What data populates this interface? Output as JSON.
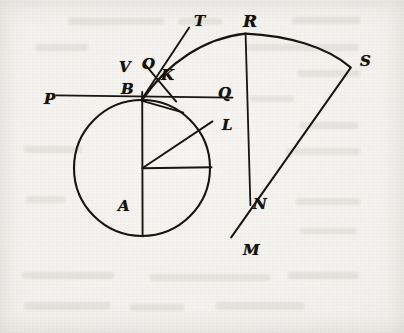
{
  "figure": {
    "kind": "geometric-construction-diagram",
    "medium": "scanned engraving on aged paper",
    "background_color": "#f2f0ec",
    "ink_color": "#151310",
    "width": 404,
    "height": 333
  },
  "labels": [
    {
      "id": "P",
      "text": "P",
      "x": 44,
      "y": 92,
      "size": "md",
      "role": "left end of horizontal line through B"
    },
    {
      "id": "V",
      "text": "V",
      "x": 119,
      "y": 60,
      "size": "md",
      "role": "upper-left point above B"
    },
    {
      "id": "O",
      "text": "O",
      "x": 142,
      "y": 57,
      "size": "md",
      "role": "point on vertical above B"
    },
    {
      "id": "B",
      "text": "B",
      "x": 121,
      "y": 82,
      "size": "md",
      "role": "top of circle, vertex of sector"
    },
    {
      "id": "K",
      "text": "K",
      "x": 161,
      "y": 68,
      "size": "md",
      "role": "intersection of the two oblique lines"
    },
    {
      "id": "T",
      "text": "T",
      "x": 194,
      "y": 14,
      "size": "md",
      "role": "upper end of oblique line from B"
    },
    {
      "id": "R",
      "text": "R",
      "x": 243,
      "y": 13,
      "size": "lg",
      "role": "start of outer circular arc"
    },
    {
      "id": "S",
      "text": "S",
      "x": 360,
      "y": 54,
      "size": "md",
      "role": "far end of outer circular arc"
    },
    {
      "id": "Q",
      "text": "Q",
      "x": 218,
      "y": 86,
      "size": "md",
      "role": "right end of horizontal line through B"
    },
    {
      "id": "L",
      "text": "L",
      "x": 222,
      "y": 118,
      "size": "md",
      "role": "point on circle along radius AL"
    },
    {
      "id": "A",
      "text": "A",
      "x": 118,
      "y": 199,
      "size": "md",
      "role": "centre of the circle"
    },
    {
      "id": "N",
      "text": "N",
      "x": 253,
      "y": 197,
      "size": "md",
      "role": "right of circle on horizontal radius"
    },
    {
      "id": "M",
      "text": "M",
      "x": 243,
      "y": 243,
      "size": "md",
      "role": "point on circle below N"
    }
  ],
  "geometry": {
    "circle": {
      "cx": 142,
      "cy": 168,
      "r": 68,
      "label": "circle centred at A through B, N and M"
    },
    "points": {
      "A": {
        "x": 142,
        "y": 168
      },
      "B": {
        "x": 142,
        "y": 100
      },
      "N": {
        "x": 210,
        "y": 168
      },
      "L": {
        "x": 206,
        "y": 124
      },
      "O": {
        "x": 146,
        "y": 73
      },
      "K": {
        "x": 156,
        "y": 82
      },
      "T": {
        "x": 188,
        "y": 28
      },
      "R": {
        "x": 245,
        "y": 33
      },
      "S": {
        "x": 350,
        "y": 68
      },
      "M": {
        "x": 232,
        "y": 232
      },
      "P": {
        "x": 56,
        "y": 96
      },
      "Q": {
        "x": 232,
        "y": 96
      }
    },
    "segments": [
      {
        "name": "PQ-secant-through-B",
        "from": "P",
        "to": "Q"
      },
      {
        "name": "vertical-diameter-B-to-bottom",
        "from": "B",
        "to": "bottom-of-circle"
      },
      {
        "name": "radius-A-to-N",
        "from": "A",
        "to": "N"
      },
      {
        "name": "radius-A-to-L",
        "from": "A",
        "to": "L"
      },
      {
        "name": "oblique-B-to-T",
        "from": "B",
        "to": "T"
      },
      {
        "name": "oblique-O-to-K-extended",
        "from": "O",
        "to": "below-right-of-B"
      },
      {
        "name": "chord-R-to-N-vertical",
        "from": "R",
        "to": "N"
      },
      {
        "name": "radius-S-to-M",
        "from": "S",
        "to": "M"
      }
    ],
    "arcs": [
      {
        "name": "inner-arc-B-to-R",
        "from": "B",
        "to": "R",
        "description": "arc of the sector's inner boundary rising from B to R"
      },
      {
        "name": "outer-arc-R-to-S",
        "from": "R",
        "to": "S",
        "description": "outer arc of the circular sector"
      },
      {
        "name": "main-circle",
        "description": "full circle centred at A"
      }
    ]
  }
}
